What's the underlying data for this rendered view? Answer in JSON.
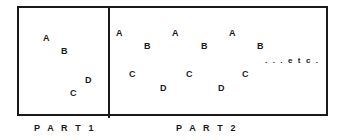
{
  "figure": {
    "background_color": "#ffffff",
    "line_color": "#1a1a1a",
    "panels": [
      {
        "id": "part-1",
        "caption": "P A R T   1",
        "tokens": [
          {
            "label": "A",
            "x": 43,
            "y": 34
          },
          {
            "label": "B",
            "x": 61,
            "y": 47
          },
          {
            "label": "D",
            "x": 85,
            "y": 76
          },
          {
            "label": "C",
            "x": 70,
            "y": 89
          }
        ]
      },
      {
        "id": "part-2",
        "caption": "P A R T   2",
        "tokens": [
          {
            "label": "A",
            "x": 116,
            "y": 29
          },
          {
            "label": "B",
            "x": 144,
            "y": 42
          },
          {
            "label": "C",
            "x": 129,
            "y": 70
          },
          {
            "label": "D",
            "x": 160,
            "y": 84
          },
          {
            "label": "A",
            "x": 172,
            "y": 29
          },
          {
            "label": "B",
            "x": 201,
            "y": 42
          },
          {
            "label": "C",
            "x": 186,
            "y": 70
          },
          {
            "label": "D",
            "x": 218,
            "y": 84
          },
          {
            "label": "A",
            "x": 229,
            "y": 29
          },
          {
            "label": "B",
            "x": 257,
            "y": 42
          },
          {
            "label": "C",
            "x": 242,
            "y": 70
          }
        ],
        "etc_label": {
          "text": ". . . e t c .",
          "x": 265,
          "y": 57
        }
      }
    ],
    "captions": [
      {
        "text": "P A R T   1",
        "x": 34,
        "y": 124
      },
      {
        "text": "P A R T   2",
        "x": 176,
        "y": 124
      }
    ]
  }
}
